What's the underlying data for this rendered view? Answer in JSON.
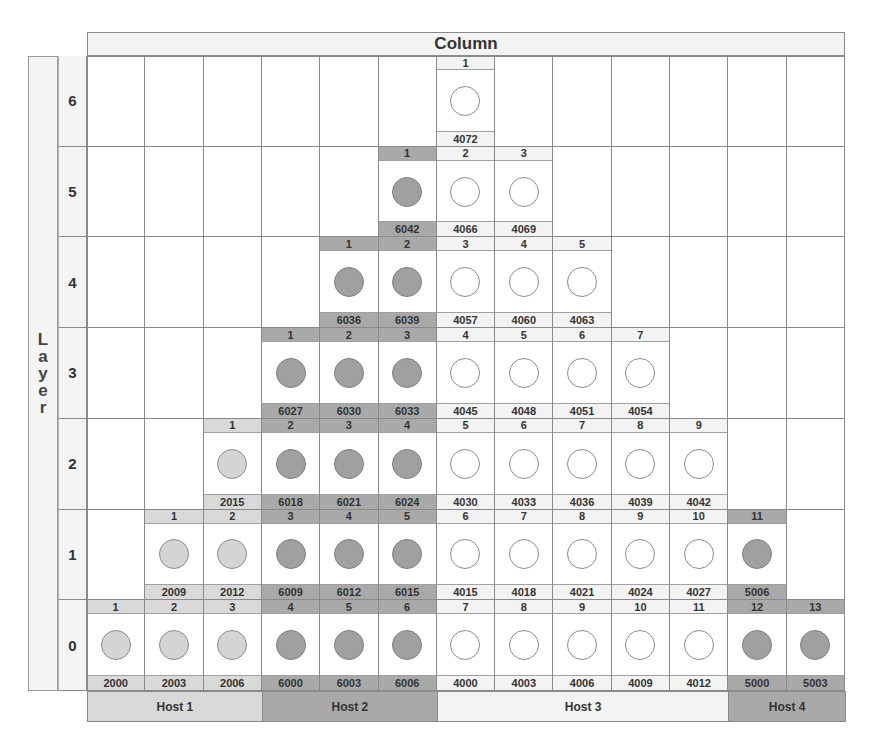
{
  "header": {
    "title": "Column"
  },
  "side_label": {
    "title": "Layer",
    "letters": [
      "L",
      "a",
      "y",
      "e",
      "r"
    ]
  },
  "layers": [
    6,
    5,
    4,
    3,
    2,
    1,
    0
  ],
  "num_columns": 13,
  "hosts": [
    {
      "id": "H1",
      "label": "Host 1",
      "start_col": 1,
      "end_col": 3,
      "strip": "#d9d9d9",
      "disk_fill": "#d4d4d4",
      "disk_border": "#8c8c8c"
    },
    {
      "id": "H2",
      "label": "Host 2",
      "start_col": 4,
      "end_col": 6,
      "strip": "#a9a9a9",
      "disk_fill": "#a0a0a0",
      "disk_border": "#7f7f7f"
    },
    {
      "id": "H3",
      "label": "Host 3",
      "start_col": 7,
      "end_col": 11,
      "strip": "#f3f3f3",
      "disk_fill": "#ffffff",
      "disk_border": "#8c8c8c"
    },
    {
      "id": "H4",
      "label": "Host 4",
      "start_col": 12,
      "end_col": 13,
      "strip": "#a9a9a9",
      "disk_fill": "#a0a0a0",
      "disk_border": "#7f7f7f"
    }
  ],
  "rows": [
    {
      "layer": 6,
      "slots": [
        {
          "col": 7,
          "index": "1",
          "port": "4072",
          "host": "H3"
        }
      ]
    },
    {
      "layer": 5,
      "slots": [
        {
          "col": 6,
          "index": "1",
          "port": "6042",
          "host": "H2"
        },
        {
          "col": 7,
          "index": "2",
          "port": "4066",
          "host": "H3"
        },
        {
          "col": 8,
          "index": "3",
          "port": "4069",
          "host": "H3"
        }
      ]
    },
    {
      "layer": 4,
      "slots": [
        {
          "col": 5,
          "index": "1",
          "port": "6036",
          "host": "H2"
        },
        {
          "col": 6,
          "index": "2",
          "port": "6039",
          "host": "H2"
        },
        {
          "col": 7,
          "index": "3",
          "port": "4057",
          "host": "H3"
        },
        {
          "col": 8,
          "index": "4",
          "port": "4060",
          "host": "H3"
        },
        {
          "col": 9,
          "index": "5",
          "port": "4063",
          "host": "H3"
        }
      ]
    },
    {
      "layer": 3,
      "slots": [
        {
          "col": 4,
          "index": "1",
          "port": "6027",
          "host": "H2"
        },
        {
          "col": 5,
          "index": "2",
          "port": "6030",
          "host": "H2"
        },
        {
          "col": 6,
          "index": "3",
          "port": "6033",
          "host": "H2"
        },
        {
          "col": 7,
          "index": "4",
          "port": "4045",
          "host": "H3"
        },
        {
          "col": 8,
          "index": "5",
          "port": "4048",
          "host": "H3"
        },
        {
          "col": 9,
          "index": "6",
          "port": "4051",
          "host": "H3"
        },
        {
          "col": 10,
          "index": "7",
          "port": "4054",
          "host": "H3"
        }
      ]
    },
    {
      "layer": 2,
      "slots": [
        {
          "col": 3,
          "index": "1",
          "port": "2015",
          "host": "H1"
        },
        {
          "col": 4,
          "index": "2",
          "port": "6018",
          "host": "H2"
        },
        {
          "col": 5,
          "index": "3",
          "port": "6021",
          "host": "H2"
        },
        {
          "col": 6,
          "index": "4",
          "port": "6024",
          "host": "H2"
        },
        {
          "col": 7,
          "index": "5",
          "port": "4030",
          "host": "H3"
        },
        {
          "col": 8,
          "index": "6",
          "port": "4033",
          "host": "H3"
        },
        {
          "col": 9,
          "index": "7",
          "port": "4036",
          "host": "H3"
        },
        {
          "col": 10,
          "index": "8",
          "port": "4039",
          "host": "H3"
        },
        {
          "col": 11,
          "index": "9",
          "port": "4042",
          "host": "H3"
        }
      ]
    },
    {
      "layer": 1,
      "slots": [
        {
          "col": 2,
          "index": "1",
          "port": "2009",
          "host": "H1"
        },
        {
          "col": 3,
          "index": "2",
          "port": "2012",
          "host": "H1"
        },
        {
          "col": 4,
          "index": "3",
          "port": "6009",
          "host": "H2"
        },
        {
          "col": 5,
          "index": "4",
          "port": "6012",
          "host": "H2"
        },
        {
          "col": 6,
          "index": "5",
          "port": "6015",
          "host": "H2"
        },
        {
          "col": 7,
          "index": "6",
          "port": "4015",
          "host": "H3"
        },
        {
          "col": 8,
          "index": "7",
          "port": "4018",
          "host": "H3"
        },
        {
          "col": 9,
          "index": "8",
          "port": "4021",
          "host": "H3"
        },
        {
          "col": 10,
          "index": "9",
          "port": "4024",
          "host": "H3"
        },
        {
          "col": 11,
          "index": "10",
          "port": "4027",
          "host": "H3"
        },
        {
          "col": 12,
          "index": "11",
          "port": "5006",
          "host": "H4"
        }
      ]
    },
    {
      "layer": 0,
      "slots": [
        {
          "col": 1,
          "index": "1",
          "port": "2000",
          "host": "H1"
        },
        {
          "col": 2,
          "index": "2",
          "port": "2003",
          "host": "H1"
        },
        {
          "col": 3,
          "index": "3",
          "port": "2006",
          "host": "H1"
        },
        {
          "col": 4,
          "index": "4",
          "port": "6000",
          "host": "H2"
        },
        {
          "col": 5,
          "index": "5",
          "port": "6003",
          "host": "H2"
        },
        {
          "col": 6,
          "index": "6",
          "port": "6006",
          "host": "H2"
        },
        {
          "col": 7,
          "index": "7",
          "port": "4000",
          "host": "H3"
        },
        {
          "col": 8,
          "index": "8",
          "port": "4003",
          "host": "H3"
        },
        {
          "col": 9,
          "index": "9",
          "port": "4006",
          "host": "H3"
        },
        {
          "col": 10,
          "index": "10",
          "port": "4009",
          "host": "H3"
        },
        {
          "col": 11,
          "index": "11",
          "port": "4012",
          "host": "H3"
        },
        {
          "col": 12,
          "index": "12",
          "port": "5000",
          "host": "H4"
        },
        {
          "col": 13,
          "index": "13",
          "port": "5003",
          "host": "H4"
        }
      ]
    }
  ]
}
